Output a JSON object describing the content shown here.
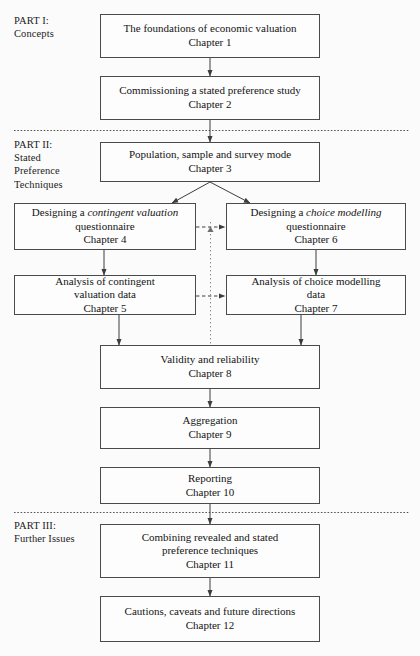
{
  "diagram": {
    "title_parts": [
      {
        "id": "part-1",
        "label": "PART I:\nConcepts"
      },
      {
        "id": "part-2",
        "label": "PART II:\nStated\nPreference\nTechniques"
      },
      {
        "id": "part-3",
        "label": "PART III:\nFurther Issues"
      }
    ],
    "nodes": {
      "ch1": {
        "line1": "The foundations of economic valuation",
        "line2": "Chapter 1"
      },
      "ch2": {
        "line1": "Commissioning a stated preference study",
        "line2": "Chapter 2"
      },
      "ch3": {
        "line1": "Population, sample and survey mode",
        "line2": "Chapter 3"
      },
      "ch4": {
        "pre": "Designing a ",
        "em": "contingent valuation",
        "line2": "questionnaire",
        "line3": "Chapter 4"
      },
      "ch6": {
        "pre": "Designing a ",
        "em": "choice modelling",
        "line2": "questionnaire",
        "line3": "Chapter 6"
      },
      "ch5": {
        "line1": "Analysis of contingent",
        "line2": "valuation data",
        "line3": "Chapter 5"
      },
      "ch7": {
        "line1": "Analysis of choice modelling",
        "line2": "data",
        "line3": "Chapter 7"
      },
      "ch8": {
        "line1": "Validity and reliability",
        "line2": "Chapter 8"
      },
      "ch9": {
        "line1": "Aggregation",
        "line2": "Chapter 9"
      },
      "ch10": {
        "line1": "Reporting",
        "line2": "Chapter 10"
      },
      "ch11": {
        "line1": "Combining revealed and stated",
        "line2": "preference techniques",
        "line3": "Chapter 11"
      },
      "ch12": {
        "line1": "Cautions, caveats and future directions",
        "line2": "Chapter 12"
      }
    },
    "colors": {
      "box_border": "#4a4a4a",
      "box_fill": "#fdfdfd",
      "connector": "#3c3c3c",
      "divider": "#555555",
      "background": "#fbfbfb"
    },
    "connectors": [
      {
        "from": "ch1",
        "to": "ch2",
        "style": "solid"
      },
      {
        "from": "ch2",
        "to": "ch3",
        "style": "solid"
      },
      {
        "from": "ch3",
        "to": "ch4",
        "style": "solid"
      },
      {
        "from": "ch3",
        "to": "ch6",
        "style": "solid"
      },
      {
        "from": "ch4",
        "to": "ch5",
        "style": "solid"
      },
      {
        "from": "ch6",
        "to": "ch7",
        "style": "solid"
      },
      {
        "from": "ch4",
        "to": "ch6",
        "style": "dashed"
      },
      {
        "from": "ch5",
        "to": "ch7",
        "style": "dashed"
      },
      {
        "from": "ch5",
        "to": "ch8",
        "style": "solid"
      },
      {
        "from": "ch7",
        "to": "ch8",
        "style": "solid"
      },
      {
        "from": "ch8",
        "to": "ch9",
        "style": "solid"
      },
      {
        "from": "ch9",
        "to": "ch10",
        "style": "solid"
      },
      {
        "from": "ch10",
        "to": "ch11",
        "style": "solid"
      },
      {
        "from": "ch11",
        "to": "ch12",
        "style": "solid"
      }
    ],
    "dividers": [
      {
        "id": "divider-part-1-2",
        "y": 130
      },
      {
        "id": "divider-part-2-3",
        "y": 512
      }
    ]
  }
}
